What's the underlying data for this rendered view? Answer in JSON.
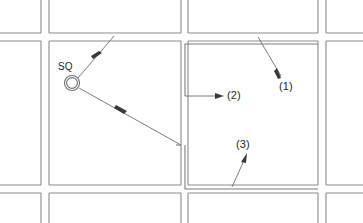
{
  "diagram": {
    "type": "floor-plan-callout",
    "width": 363,
    "height": 223,
    "background_color": "#ffffff",
    "wall_color": "#8b8b8b",
    "leader_color": "#6e6e6e",
    "text_color": "#262626"
  },
  "symbols": [
    {
      "id": "sq-symbol",
      "label": "SQ",
      "shape": "double-circle",
      "x": 72,
      "y": 83,
      "outer_radius": 7.5,
      "inner_radius": 5.4,
      "label_x": 58,
      "label_y": 62
    }
  ],
  "callouts": [
    {
      "id": "callout-1",
      "label": "(1)",
      "label_x": 279,
      "label_y": 81,
      "leader_from": [
        258,
        37
      ],
      "leader_to": [
        280,
        75
      ],
      "arrow_at": "end"
    },
    {
      "id": "callout-2",
      "label": "(2)",
      "label_x": 227,
      "label_y": 90,
      "leader_from": [
        185,
        96
      ],
      "leader_to": [
        222,
        96
      ],
      "arrow_at": "end"
    },
    {
      "id": "callout-3",
      "label": "(3)",
      "label_x": 236,
      "label_y": 139,
      "leader_from": [
        232,
        187
      ],
      "leader_to": [
        246,
        155
      ],
      "arrow_at": "end"
    }
  ],
  "sq_leaders": [
    {
      "id": "sq-leader-upper",
      "from": [
        78,
        78
      ],
      "to": [
        114,
        36
      ],
      "arrow_at": "middle",
      "arrow_point": [
        96,
        56
      ]
    },
    {
      "id": "sq-leader-lower",
      "from": [
        79,
        88
      ],
      "to": [
        181,
        145
      ],
      "arrow_at": "middle",
      "arrow_point": [
        122,
        112
      ]
    }
  ],
  "walls": {
    "vertical_left_x": [
      41,
      49
    ],
    "vertical_mid_x": [
      181,
      188
    ],
    "vertical_right_x": [
      318,
      326
    ],
    "horizontal_top_y": [
      33,
      41
    ],
    "horizontal_bottom_y": [
      185,
      193
    ]
  },
  "legend": {
    "sq_meaning": "SQ",
    "callout_labels": [
      "(1)",
      "(2)",
      "(3)"
    ]
  }
}
